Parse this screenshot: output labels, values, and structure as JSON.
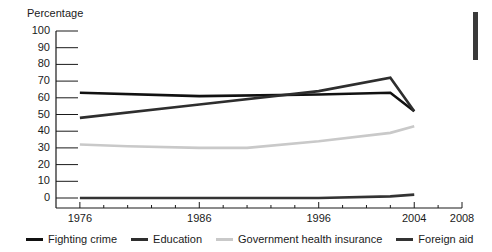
{
  "chart_data": {
    "type": "line",
    "title": "",
    "ylabel": "Percentage",
    "xlabel": "",
    "ylim": [
      0,
      100
    ],
    "xlim": [
      1974,
      2008
    ],
    "yticks": [
      100,
      90,
      80,
      70,
      60,
      50,
      40,
      30,
      20,
      10,
      0
    ],
    "xticks": [
      1976,
      1986,
      1996,
      2004,
      2008
    ],
    "xtick_labels": [
      "1976",
      "1986",
      "1996",
      "2004",
      "2008"
    ],
    "grid": false,
    "legend_position": "bottom",
    "series": [
      {
        "name": "Fighting crime",
        "color": "#111111",
        "x": [
          1976,
          1986,
          1996,
          2002,
          2004
        ],
        "values": [
          63,
          61,
          62,
          63,
          52
        ]
      },
      {
        "name": "Education",
        "color": "#2e2e2e",
        "x": [
          1976,
          1986,
          1996,
          2002,
          2004
        ],
        "values": [
          48,
          56,
          64,
          72,
          52
        ]
      },
      {
        "name": "Government health insurance",
        "color": "#c9c9c9",
        "x": [
          1976,
          1980,
          1986,
          1990,
          1996,
          2002,
          2004
        ],
        "values": [
          32,
          31,
          30,
          30,
          34,
          39,
          43
        ]
      },
      {
        "name": "Foreign aid",
        "color": "#333333",
        "x": [
          1976,
          1986,
          1996,
          2002,
          2004
        ],
        "values": [
          0,
          0,
          0,
          1,
          2
        ]
      }
    ]
  },
  "axis": {
    "ylabel": "Percentage",
    "ytick_labels": [
      "100",
      "90",
      "80",
      "70",
      "60",
      "50",
      "40",
      "30",
      "20",
      "10",
      "0"
    ],
    "xtick_labels": [
      "1976",
      "1986",
      "1996",
      "2004",
      "2008"
    ]
  },
  "legend": {
    "items": [
      {
        "label": "Fighting crime",
        "color": "#111111"
      },
      {
        "label": "Education",
        "color": "#2e2e2e"
      },
      {
        "label": "Government health insurance",
        "color": "#c9c9c9"
      },
      {
        "label": "Foreign aid",
        "color": "#333333"
      }
    ]
  },
  "marks": {
    "side_bar_color": "#3a3a3a"
  }
}
